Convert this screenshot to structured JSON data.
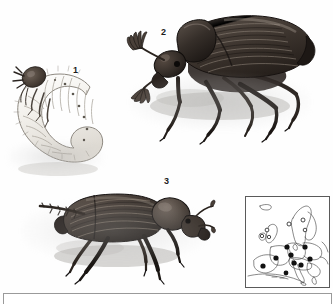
{
  "plate": {
    "title": "Cockchafer plate",
    "background_color": "#fefefe",
    "ink_color": "#1c1c1c"
  },
  "figures": [
    {
      "number": "1",
      "name": "larva",
      "description": "C-shaped white scarab grub with brown head capsule and three pairs of thoracic legs",
      "label_x": 73,
      "label_y": 66
    },
    {
      "number": "2",
      "name": "beetle-dorsolateral",
      "description": "Dark brown cockchafer beetle facing left with fan-shaped lamellate antennae, ribbed elytra",
      "label_x": 161,
      "label_y": 28
    },
    {
      "number": "3",
      "name": "beetle-lateral",
      "description": "Dark cockchafer beetle facing right with ribbed elytra and long hind legs",
      "label_x": 164,
      "label_y": 177
    }
  ],
  "map": {
    "name": "europe-distribution-map",
    "region": "Europe",
    "frame_color": "#5a5a5a",
    "legend": {
      "filled_dot": "present / recorded",
      "open_circle": "absent or unconfirmed"
    },
    "filled_dots": [
      {
        "x": 41,
        "y": 50
      },
      {
        "x": 59,
        "y": 50
      },
      {
        "x": 30,
        "y": 61
      },
      {
        "x": 45,
        "y": 58
      },
      {
        "x": 48,
        "y": 66
      },
      {
        "x": 55,
        "y": 68
      },
      {
        "x": 64,
        "y": 62
      },
      {
        "x": 17,
        "y": 69
      },
      {
        "x": 40,
        "y": 76
      }
    ],
    "open_circles": [
      {
        "x": 21,
        "y": 33
      },
      {
        "x": 16,
        "y": 39
      },
      {
        "x": 23,
        "y": 40
      },
      {
        "x": 43,
        "y": 27
      },
      {
        "x": 57,
        "y": 23
      },
      {
        "x": 59,
        "y": 33
      }
    ]
  },
  "colors": {
    "ink": "#1c1c1c",
    "beetle_dark": "#3a3330",
    "beetle_mid": "#6a5f58",
    "larva_light": "#f4f2ee",
    "paper": "#ffffff",
    "frame": "#9a9a9a"
  }
}
